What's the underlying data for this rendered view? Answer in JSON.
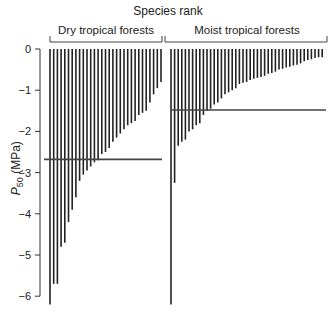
{
  "chart_data": {
    "type": "bar",
    "title": "Species rank",
    "xlabel": "Species rank",
    "ylabel": "P50 (MPa)",
    "ylim": [
      -6.3,
      0
    ],
    "yticks": [
      0,
      -1,
      -2,
      -3,
      -4,
      -5,
      -6
    ],
    "grid": false,
    "groups": [
      {
        "name": "Dry tropical forests",
        "reference_line": -2.68,
        "values": [
          -6.2,
          -5.7,
          -5.7,
          -4.8,
          -4.7,
          -4.2,
          -3.9,
          -3.6,
          -3.2,
          -3.05,
          -2.95,
          -2.85,
          -2.75,
          -2.7,
          -2.55,
          -2.5,
          -2.4,
          -2.25,
          -2.15,
          -2.05,
          -1.95,
          -1.85,
          -1.8,
          -1.75,
          -1.6,
          -1.55,
          -1.5,
          -1.3,
          -1.1,
          -0.95,
          -0.8
        ]
      },
      {
        "name": "Moist tropical forests",
        "reference_line": -1.48,
        "values": [
          -6.2,
          -3.25,
          -2.35,
          -2.25,
          -2.2,
          -2.0,
          -1.95,
          -1.85,
          -1.8,
          -1.6,
          -1.5,
          -1.45,
          -1.35,
          -1.3,
          -1.2,
          -1.1,
          -1.05,
          -1.0,
          -0.95,
          -0.85,
          -0.82,
          -0.8,
          -0.75,
          -0.72,
          -0.7,
          -0.68,
          -0.65,
          -0.6,
          -0.58,
          -0.55,
          -0.5,
          -0.48,
          -0.45,
          -0.43,
          -0.4,
          -0.38,
          -0.35,
          -0.3,
          -0.27,
          -0.25,
          -0.22,
          -0.2,
          -0.2
        ]
      }
    ]
  },
  "labels": {
    "title": "Species rank",
    "dry": "Dry tropical forests",
    "moist": "Moist tropical forests",
    "ylabel_main": "P",
    "ylabel_sub": "50",
    "ylabel_unit": " (MPa)"
  }
}
